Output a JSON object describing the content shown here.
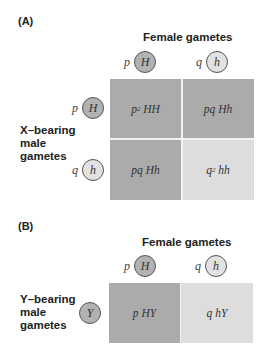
{
  "panel_a": {
    "label": "(A)",
    "column_header": "Female gametes",
    "columns": [
      {
        "freq": "p",
        "allele": "H"
      },
      {
        "freq": "q",
        "allele": "h"
      }
    ],
    "row_label": [
      "X–bearing",
      "male",
      "gametes"
    ],
    "rows": [
      {
        "freq": "p",
        "allele": "H"
      },
      {
        "freq": "q",
        "allele": "h"
      }
    ],
    "cells": [
      [
        {
          "coef": "p",
          "exp": "2",
          "genotype": "HH"
        },
        {
          "coef": "pq",
          "exp": "",
          "genotype": "Hh"
        }
      ],
      [
        {
          "coef": "pq",
          "exp": "",
          "genotype": "Hh"
        },
        {
          "coef": "q",
          "exp": "2",
          "genotype": "hh"
        }
      ]
    ]
  },
  "panel_b": {
    "label": "(B)",
    "column_header": "Female gametes",
    "columns": [
      {
        "freq": "p",
        "allele": "H"
      },
      {
        "freq": "q",
        "allele": "h"
      }
    ],
    "row_label": [
      "Y–bearing",
      "male",
      "gametes"
    ],
    "rows": [
      {
        "freq": "",
        "allele": "Y"
      }
    ],
    "cells": [
      [
        {
          "coef": "p",
          "exp": "",
          "genotype": "HY"
        },
        {
          "coef": "q",
          "exp": "",
          "genotype": "hY"
        }
      ]
    ]
  },
  "colors": {
    "dark_cell": "#ababab",
    "light_cell": "#dddddd",
    "dark_circle": "#b2b2b2",
    "light_circle": "#e2e2e2"
  }
}
